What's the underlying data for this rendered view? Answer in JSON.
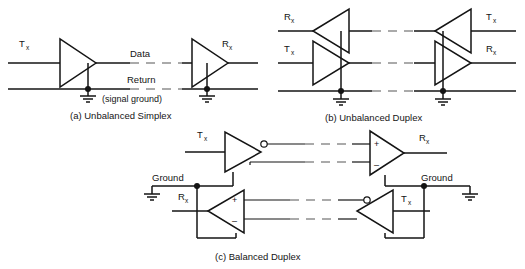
{
  "figure": {
    "title_visible": false,
    "background": "#ffffff",
    "line_color": "#141414",
    "dash_color": "#8e8e8e"
  },
  "panels": [
    {
      "id": "a",
      "caption": "(a) Unbalanced Simplex",
      "labels": {
        "left_driver": "T",
        "left_driver_sub": "x",
        "right_receiver": "R",
        "right_receiver_sub": "x",
        "data_line": "Data",
        "return_line": "Return",
        "return_note": "(signal ground)"
      },
      "elements": {
        "drivers": 1,
        "receivers": 1,
        "ground_symbols": 2,
        "junction_dots": 2,
        "signal_lines": 2,
        "dashed_breaks": 2
      }
    },
    {
      "id": "b",
      "caption": "(b) Unbalanced Duplex",
      "labels": {
        "left_top": "R",
        "left_top_sub": "x",
        "left_bottom": "T",
        "left_bottom_sub": "x",
        "right_top": "T",
        "right_top_sub": "x",
        "right_bottom": "R",
        "right_bottom_sub": "x"
      },
      "elements": {
        "drivers": 2,
        "receivers": 2,
        "ground_symbols": 2,
        "junction_dots": 2,
        "signal_lines": 3,
        "dashed_breaks": 3
      }
    },
    {
      "id": "c",
      "caption": "(c) Balanced Duplex",
      "labels": {
        "top_left": "T",
        "top_left_sub": "x",
        "top_right": "R",
        "top_right_sub": "x",
        "bottom_left": "R",
        "bottom_left_sub": "x",
        "bottom_right": "T",
        "bottom_right_sub": "x",
        "ground_left": "Ground",
        "ground_right": "Ground",
        "plus": "+",
        "minus": "–"
      },
      "elements": {
        "drivers": 2,
        "receivers": 2,
        "ground_symbols": 2,
        "junction_dots": 2,
        "twisted_pairs": 2,
        "dashed_breaks": 4,
        "inverting_bubbles": 2
      }
    }
  ]
}
